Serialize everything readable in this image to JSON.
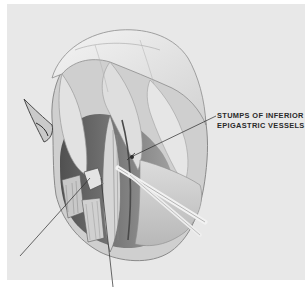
{
  "figure": {
    "type": "anatomical-illustration",
    "style": "pencil drawing, grayscale",
    "background_color": "#e8e8e8",
    "labels": [
      {
        "id": "inferior-epigastric-stumps",
        "lines": [
          "STUMPS OF INFERIOR",
          "EPIGASTRIC VESSELS"
        ],
        "leader_line": {
          "from": [
            216,
            116
          ],
          "to": [
            131,
            157
          ]
        }
      }
    ],
    "unlabeled_leader_lines": [
      {
        "from": [
          20,
          256
        ],
        "to": [
          90,
          178
        ]
      },
      {
        "from": [
          113,
          287
        ],
        "to": [
          101,
          178
        ]
      }
    ]
  }
}
